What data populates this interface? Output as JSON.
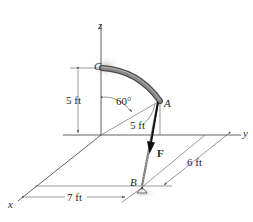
{
  "figure": {
    "type": "statics-3d-diagram",
    "axes": {
      "x_label": "x",
      "y_label": "y",
      "z_label": "z"
    },
    "points": {
      "A": "A",
      "B": "B",
      "C": "C"
    },
    "force_label": "F",
    "dimensions": {
      "height_C": "5 ft",
      "radius": "5 ft",
      "angle": "60°",
      "dist_x": "7 ft",
      "dist_y": "6 ft"
    },
    "colors": {
      "lines": "#3a3a3a",
      "tube": "#6e6e6e",
      "force_arrow": "#111111",
      "shadow": "#cfcfcf"
    }
  }
}
